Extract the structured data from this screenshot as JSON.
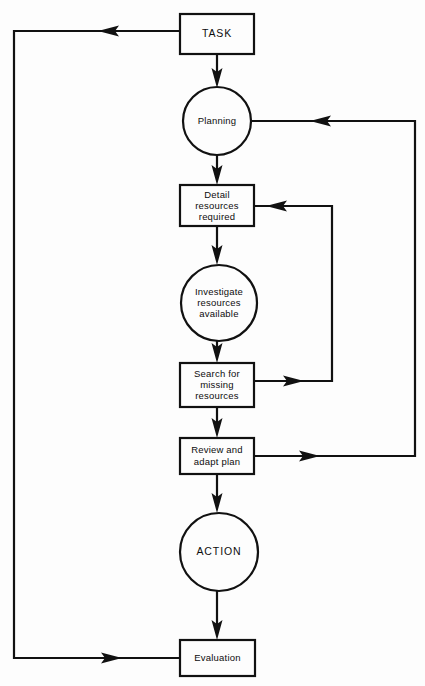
{
  "diagram": {
    "background_color": "#fdfdfd",
    "line_color": "#111111",
    "text_color": "#0d0d0d",
    "type": "flowchart",
    "nodes": [
      {
        "id": "task",
        "shape": "rectangle",
        "label": "TASK",
        "lines": [
          "TASK"
        ],
        "x": 180,
        "y": 14,
        "width": 74,
        "height": 40
      },
      {
        "id": "planning",
        "shape": "circle",
        "label": "Planning",
        "lines": [
          "Planning"
        ],
        "cx": 217,
        "cy": 121,
        "r": 34
      },
      {
        "id": "detail-resources-required",
        "shape": "rectangle",
        "label": "Detail resources required",
        "lines": [
          "Detail",
          "resources",
          "required"
        ],
        "x": 180,
        "y": 185,
        "width": 74,
        "height": 41
      },
      {
        "id": "investigate-resources-available",
        "shape": "circle",
        "label": "Investigate resources available",
        "lines": [
          "Investigate",
          "resources",
          "available"
        ],
        "cx": 219,
        "cy": 303,
        "r": 38
      },
      {
        "id": "search-for-missing-resources",
        "shape": "rectangle",
        "label": "Search for missing resources",
        "lines": [
          "Search for",
          "missing",
          "resources"
        ],
        "x": 180,
        "y": 363,
        "width": 74,
        "height": 44
      },
      {
        "id": "review-and-adapt-plan",
        "shape": "rectangle",
        "label": "Review and adapt plan",
        "lines": [
          "Review and",
          "adapt plan"
        ],
        "x": 180,
        "y": 438,
        "width": 74,
        "height": 36
      },
      {
        "id": "action",
        "shape": "circle",
        "label": "ACTION",
        "lines": [
          "ACTION"
        ],
        "cx": 219,
        "cy": 552,
        "r": 39
      },
      {
        "id": "evaluation",
        "shape": "rectangle",
        "label": "Evaluation",
        "lines": [
          "Evaluation"
        ],
        "x": 180,
        "y": 640,
        "width": 75,
        "height": 36
      }
    ],
    "edges": [
      {
        "id": "task-to-planning",
        "from": "task",
        "to": "planning",
        "direction": "down"
      },
      {
        "id": "planning-to-detail",
        "from": "planning",
        "to": "detail-resources-required",
        "direction": "down"
      },
      {
        "id": "detail-to-investigate",
        "from": "detail-resources-required",
        "to": "investigate-resources-available",
        "direction": "down"
      },
      {
        "id": "investigate-to-search",
        "from": "investigate-resources-available",
        "to": "search-for-missing-resources",
        "direction": "down"
      },
      {
        "id": "search-to-review",
        "from": "search-for-missing-resources",
        "to": "review-and-adapt-plan",
        "direction": "down"
      },
      {
        "id": "review-to-action",
        "from": "review-and-adapt-plan",
        "to": "action",
        "direction": "down"
      },
      {
        "id": "action-to-evaluation",
        "from": "action",
        "to": "evaluation",
        "direction": "down"
      },
      {
        "id": "search-loop-back-to-detail",
        "from": "search-for-missing-resources",
        "to": "detail-resources-required",
        "direction": "loop-right-inner"
      },
      {
        "id": "review-loop-back-to-planning",
        "from": "review-and-adapt-plan",
        "to": "planning",
        "direction": "loop-right-outer"
      },
      {
        "id": "evaluation-loop-back-to-task",
        "from": "evaluation",
        "to": "task",
        "direction": "loop-left-outer"
      }
    ]
  }
}
